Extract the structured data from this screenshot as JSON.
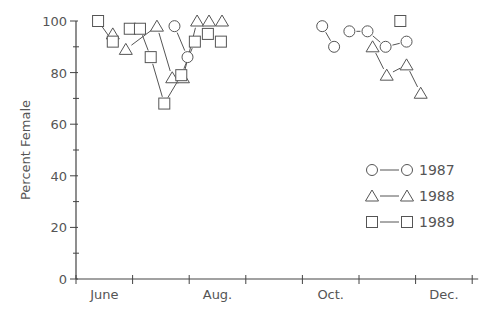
{
  "chart_data": {
    "type": "scatter",
    "title": "",
    "xlabel": "",
    "ylabel": "Percent Female",
    "ylim": [
      0,
      100
    ],
    "yticks": [
      0,
      20,
      40,
      60,
      80,
      100
    ],
    "xlim_months": [
      0,
      7
    ],
    "xtick_months": [
      0,
      1,
      2,
      3,
      4,
      5,
      6,
      7
    ],
    "x_labels": [
      {
        "label": "June",
        "pos": 0.5
      },
      {
        "label": "Aug.",
        "pos": 2.5
      },
      {
        "label": "Oct.",
        "pos": 4.5
      },
      {
        "label": "Dec.",
        "pos": 6.5
      }
    ],
    "grid": false,
    "legend_position": "right-middle",
    "x_units": "months since June 1",
    "series": [
      {
        "name": "1987",
        "marker": "circle",
        "points": [
          {
            "x": 1.74,
            "y": 98
          },
          {
            "x": 1.97,
            "y": 86
          },
          {
            "x": 4.35,
            "y": 98
          },
          {
            "x": 4.56,
            "y": 90
          },
          {
            "x": 4.83,
            "y": 96
          },
          {
            "x": 5.15,
            "y": 96
          },
          {
            "x": 5.47,
            "y": 90
          },
          {
            "x": 5.84,
            "y": 92
          }
        ],
        "segments": [
          [
            0,
            1
          ],
          [
            2,
            3
          ],
          [
            4,
            5
          ],
          [
            5,
            6
          ],
          [
            6,
            7
          ]
        ]
      },
      {
        "name": "1988",
        "marker": "triangle",
        "points": [
          {
            "x": 0.65,
            "y": 95
          },
          {
            "x": 0.88,
            "y": 89
          },
          {
            "x": 1.43,
            "y": 98
          },
          {
            "x": 1.7,
            "y": 78
          },
          {
            "x": 1.89,
            "y": 78
          },
          {
            "x": 2.14,
            "y": 100
          },
          {
            "x": 2.35,
            "y": 100
          },
          {
            "x": 2.58,
            "y": 100
          },
          {
            "x": 5.24,
            "y": 90
          },
          {
            "x": 5.49,
            "y": 79
          },
          {
            "x": 5.84,
            "y": 83
          },
          {
            "x": 6.09,
            "y": 72
          }
        ],
        "segments": [
          [
            1,
            2
          ],
          [
            2,
            3
          ],
          [
            4,
            5
          ],
          [
            8,
            9
          ],
          [
            9,
            10
          ],
          [
            10,
            11
          ]
        ]
      },
      {
        "name": "1989",
        "marker": "square",
        "points": [
          {
            "x": 0.39,
            "y": 100
          },
          {
            "x": 0.65,
            "y": 92
          },
          {
            "x": 0.95,
            "y": 97
          },
          {
            "x": 1.13,
            "y": 97
          },
          {
            "x": 1.32,
            "y": 86
          },
          {
            "x": 1.56,
            "y": 68
          },
          {
            "x": 1.86,
            "y": 79
          },
          {
            "x": 2.1,
            "y": 92
          },
          {
            "x": 2.33,
            "y": 95
          },
          {
            "x": 2.56,
            "y": 92
          },
          {
            "x": 5.73,
            "y": 100
          }
        ],
        "segments": [
          [
            0,
            1
          ],
          [
            3,
            4
          ],
          [
            4,
            5
          ],
          [
            5,
            6
          ],
          [
            6,
            7
          ]
        ]
      }
    ]
  },
  "legend": {
    "items": [
      {
        "label": "1987",
        "marker": "circle"
      },
      {
        "label": "1988",
        "marker": "triangle"
      },
      {
        "label": "1989",
        "marker": "square"
      }
    ]
  },
  "style": {
    "ink": "#555555",
    "axis": "#444444",
    "background": "#ffffff"
  }
}
